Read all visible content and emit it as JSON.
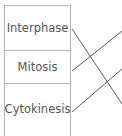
{
  "diagram": {
    "type": "matching-lines",
    "terms": [
      {
        "label": "Interphase"
      },
      {
        "label": "Mitosis"
      },
      {
        "label": "Cytokinesis"
      }
    ],
    "connectors": [
      {
        "from": "Interphase",
        "x1": 72,
        "y1": 29,
        "x2": 122,
        "y2": 104
      },
      {
        "from": "Mitosis",
        "x1": 72,
        "y1": 71,
        "x2": 122,
        "y2": 31
      },
      {
        "from": "Cytokinesis",
        "x1": 72,
        "y1": 112,
        "x2": 122,
        "y2": 69
      }
    ],
    "colors": {
      "border": "#b4b4b4",
      "line": "#555555",
      "text": "#555555"
    }
  }
}
